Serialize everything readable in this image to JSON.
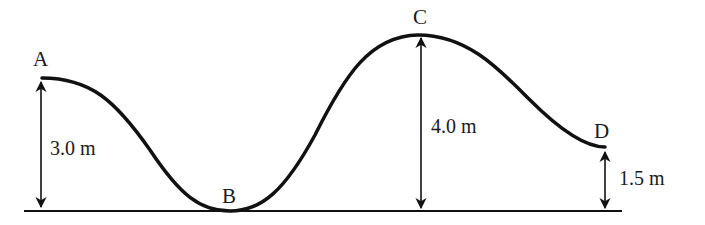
{
  "diagram": {
    "type": "roller-coaster track height profile",
    "colors": {
      "stroke": "#111111",
      "background": "#ffffff"
    },
    "points": [
      {
        "label": "A",
        "height": "3.0 m"
      },
      {
        "label": "B",
        "height": null
      },
      {
        "label": "C",
        "height": "4.0 m"
      },
      {
        "label": "D",
        "height": "1.5 m"
      }
    ]
  }
}
